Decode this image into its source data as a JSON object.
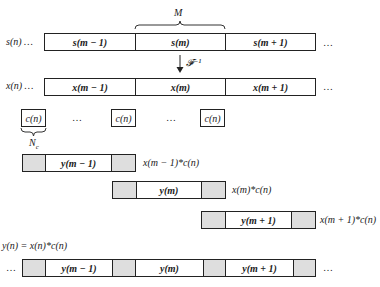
{
  "brace_top": {
    "label": "M"
  },
  "transform": {
    "label": "𝓕⁻¹"
  },
  "row_s": {
    "prefix": "s(n) …",
    "cells": [
      "s(m − 1)",
      "s(m)",
      "s(m + 1)"
    ],
    "suffix": "…"
  },
  "row_x": {
    "prefix": "x(n) …",
    "cells": [
      "x(m − 1)",
      "x(m)",
      "x(m + 1)"
    ],
    "suffix": "…"
  },
  "codes": {
    "cells": [
      "c(n)",
      "c(n)",
      "c(n)"
    ],
    "dots": [
      "…",
      "…"
    ],
    "brace_label": "Nc",
    "brace_label_main": "N",
    "brace_label_sub": "c"
  },
  "conv_rows": [
    {
      "cell": "y(m − 1)",
      "label": "x(m − 1)*c(n)"
    },
    {
      "cell": "y(m)",
      "label": "x(m)*c(n)"
    },
    {
      "cell": "y(m + 1)",
      "label": "x(m + 1)*c(n)"
    }
  ],
  "equation": "y(n) = x(n)*c(n)",
  "row_y": {
    "prefix": "…",
    "cells": [
      "y(m − 1)",
      "y(m)",
      "y(m + 1)"
    ],
    "suffix": "…"
  }
}
